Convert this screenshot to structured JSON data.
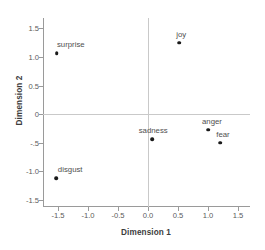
{
  "chart_data": {
    "type": "scatter",
    "title": "",
    "xlabel": "Dimension 1",
    "ylabel": "Dimension 2",
    "xlim": [
      -1.75,
      1.7
    ],
    "ylim": [
      -1.62,
      1.68
    ],
    "grid": false,
    "legend": "none",
    "zero_reference_lines": true,
    "xticks": [
      "-1.5",
      "-1.0",
      "-0.5",
      "0.0",
      "0.5",
      "1.0",
      "1.5"
    ],
    "xtick_values": [
      -1.5,
      -1.0,
      -0.5,
      0.0,
      0.5,
      1.0,
      1.5
    ],
    "yticks": [
      "1.5",
      "1.0",
      "0.5",
      "0",
      "-.5",
      "-1.0",
      "-1.5"
    ],
    "ytick_values": [
      1.5,
      1.0,
      0.5,
      0.0,
      -0.5,
      -1.0,
      -1.5
    ],
    "marker_color": "#1a1a1a",
    "points": [
      {
        "label": "surprise",
        "x": -1.52,
        "y": 1.07,
        "label_dx": 14,
        "label_dy": -4
      },
      {
        "label": "joy",
        "x": 0.52,
        "y": 1.25,
        "label_dx": 2,
        "label_dy": -4
      },
      {
        "label": "sadness",
        "x": 0.07,
        "y": -0.44,
        "label_dx": 1,
        "label_dy": -4
      },
      {
        "label": "anger",
        "x": 1.0,
        "y": -0.27,
        "label_dx": 4,
        "label_dy": -4
      },
      {
        "label": "fear",
        "x": 1.2,
        "y": -0.5,
        "label_dx": 3,
        "label_dy": -4
      },
      {
        "label": "disgust",
        "x": -1.53,
        "y": -1.12,
        "label_dx": 14,
        "label_dy": -4
      }
    ]
  }
}
